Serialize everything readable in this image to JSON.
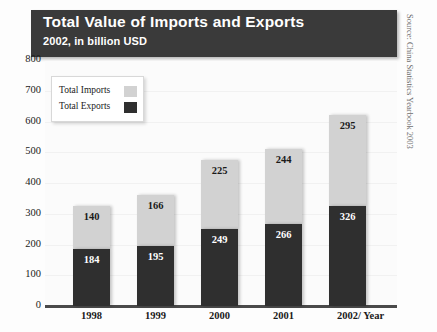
{
  "header": {
    "title": "Total Value of Imports and Exports",
    "subtitle": "2002, in billion USD"
  },
  "source": "Source: China Statistics Yearbook 2003",
  "legend": {
    "imports_label": "Total Imports",
    "exports_label": "Total Exports"
  },
  "axis": {
    "x_label": "/ Year",
    "y_ticks": [
      "800",
      "700",
      "600",
      "500",
      "400",
      "300",
      "200",
      "100",
      "0"
    ]
  },
  "colors": {
    "header_bg": "#3a3a3a",
    "exports": "#2f2f2f",
    "imports": "#d2d2d2",
    "axis": "#4a4a4a"
  },
  "chart_data": {
    "type": "bar",
    "title": "Total Value of Imports and Exports",
    "subtitle": "2002, in billion USD",
    "xlabel": "/ Year",
    "ylabel": "",
    "ylim": [
      0,
      800
    ],
    "yticks": [
      0,
      100,
      200,
      300,
      400,
      500,
      600,
      700,
      800
    ],
    "grid": true,
    "stacked": true,
    "legend_position": "top-left",
    "categories": [
      "1998",
      "1999",
      "2000",
      "2001",
      "2002"
    ],
    "series": [
      {
        "name": "Total Exports",
        "values": [
          184,
          195,
          249,
          266,
          326
        ]
      },
      {
        "name": "Total Imports",
        "values": [
          140,
          166,
          225,
          244,
          295
        ]
      }
    ],
    "totals": [
      324,
      361,
      474,
      510,
      621
    ],
    "units": "billion USD",
    "source": "Source: China Statistics Yearbook 2003"
  }
}
